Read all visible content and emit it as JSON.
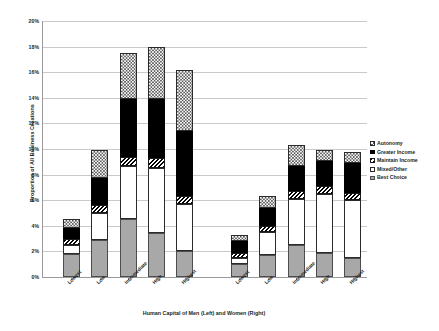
{
  "chart_data": {
    "type": "bar",
    "stacked": true,
    "title": "",
    "xlabel": "Human Capital of Men (Left) and Women (Right)",
    "ylabel": "Proportion of All Business Creations",
    "ylim": [
      0,
      20
    ],
    "ytick_labels": [
      "0%",
      "2%",
      "4%",
      "6%",
      "8%",
      "10%",
      "12%",
      "14%",
      "16%",
      "18%",
      "20%"
    ],
    "ytick_values": [
      0,
      2,
      4,
      6,
      8,
      10,
      12,
      14,
      16,
      18,
      20
    ],
    "grid": true,
    "legend_position": "right",
    "groups": [
      {
        "name": "Men (Left)",
        "categories": [
          "Lowest",
          "Low",
          "Intermediate",
          "High",
          "Highest"
        ]
      },
      {
        "name": "Women (Right)",
        "categories": [
          "Lowest",
          "Low",
          "Intermediate",
          "High",
          "Highest"
        ]
      }
    ],
    "categories": [
      "Lowest",
      "Low",
      "Intermediate",
      "High",
      "Highest",
      "Lowest",
      "Low",
      "Intermediate",
      "High",
      "Highest"
    ],
    "series": [
      {
        "name": "Best Choice",
        "swatch": "gray",
        "values": [
          1.8,
          2.9,
          4.5,
          3.4,
          2.0,
          1.0,
          1.7,
          2.5,
          1.9,
          1.5
        ]
      },
      {
        "name": "Mixed/Other",
        "swatch": "white",
        "values": [
          0.7,
          2.1,
          4.2,
          5.1,
          3.7,
          0.5,
          1.8,
          3.6,
          4.6,
          4.5
        ]
      },
      {
        "name": "Maintain Income",
        "swatch": "hatch",
        "values": [
          0.5,
          0.6,
          0.7,
          0.8,
          0.6,
          0.4,
          0.5,
          0.6,
          0.6,
          0.6
        ]
      },
      {
        "name": "Greater Income",
        "swatch": "black",
        "values": [
          0.8,
          2.1,
          4.5,
          4.6,
          5.1,
          0.9,
          1.4,
          2.0,
          2.0,
          2.3
        ]
      },
      {
        "name": "Autonomy",
        "swatch": "checkered",
        "values": [
          0.7,
          2.2,
          3.6,
          4.1,
          4.8,
          0.5,
          0.9,
          1.6,
          0.8,
          0.9
        ]
      }
    ],
    "totals": [
      4.5,
      9.9,
      17.5,
      18.0,
      16.2,
      3.3,
      6.3,
      10.3,
      9.9,
      9.8
    ],
    "legend": [
      {
        "label": "Autonomy",
        "swatch": "checkered"
      },
      {
        "label": "Greater Income",
        "swatch": "black"
      },
      {
        "label": "Maintain Income",
        "swatch": "hatch"
      },
      {
        "label": "Mixed/Other",
        "swatch": "white"
      },
      {
        "label": "Best Choice",
        "swatch": "gray"
      }
    ],
    "colors": {
      "best_choice": "#a8a8a8",
      "greater_income": "#000000",
      "background": "#ffffff",
      "gridline": "#c9c9c9",
      "axis": "#9a9a9a",
      "text": "#231f20"
    }
  }
}
